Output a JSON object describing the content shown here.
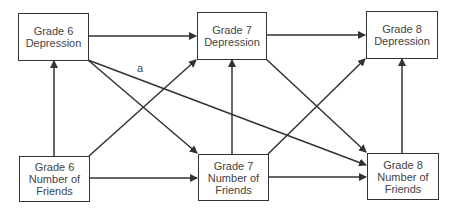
{
  "nodes": {
    "g6_dep": {
      "line1": "Grade 6",
      "line2": "Depression"
    },
    "g7_dep": {
      "line1": "Grade 7",
      "line2": "Depression"
    },
    "g8_dep": {
      "line1": "Grade 8",
      "line2": "Depression"
    },
    "g6_fr": {
      "line1": "Grade 6",
      "line2": "Number of",
      "line3": "Friends"
    },
    "g7_fr": {
      "line1": "Grade 7",
      "line2": "Number of",
      "line3": "Friends"
    },
    "g8_fr": {
      "line1": "Grade 8",
      "line2": "Number of",
      "line3": "Friends"
    }
  },
  "edge_label": "a",
  "edges": [
    {
      "from": "Grade 6 Depression",
      "to": "Grade 7 Depression"
    },
    {
      "from": "Grade 7 Depression",
      "to": "Grade 8 Depression"
    },
    {
      "from": "Grade 6 Number of Friends",
      "to": "Grade 7 Number of Friends"
    },
    {
      "from": "Grade 7 Number of Friends",
      "to": "Grade 8 Number of Friends"
    },
    {
      "from": "Grade 6 Number of Friends",
      "to": "Grade 6 Depression"
    },
    {
      "from": "Grade 7 Number of Friends",
      "to": "Grade 7 Depression"
    },
    {
      "from": "Grade 8 Number of Friends",
      "to": "Grade 8 Depression"
    },
    {
      "from": "Grade 6 Depression",
      "to": "Grade 7 Number of Friends"
    },
    {
      "from": "Grade 6 Number of Friends",
      "to": "Grade 7 Depression"
    },
    {
      "from": "Grade 7 Depression",
      "to": "Grade 8 Number of Friends"
    },
    {
      "from": "Grade 7 Number of Friends",
      "to": "Grade 8 Depression"
    },
    {
      "from": "Grade 6 Depression",
      "to": "Grade 8 Number of Friends",
      "label": "a"
    }
  ]
}
